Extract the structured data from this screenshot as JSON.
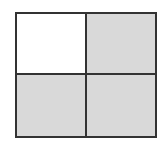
{
  "figure": {
    "type": "grid-fraction-diagram",
    "rows": 2,
    "columns": 2,
    "cells": [
      {
        "row": 0,
        "col": 0,
        "shaded": false
      },
      {
        "row": 0,
        "col": 1,
        "shaded": true
      },
      {
        "row": 1,
        "col": 0,
        "shaded": true
      },
      {
        "row": 1,
        "col": 1,
        "shaded": true
      }
    ],
    "shaded_count": 3,
    "total_count": 4,
    "colors": {
      "shaded": "#d9d9d9",
      "unshaded": "#ffffff",
      "border": "#333333"
    }
  }
}
